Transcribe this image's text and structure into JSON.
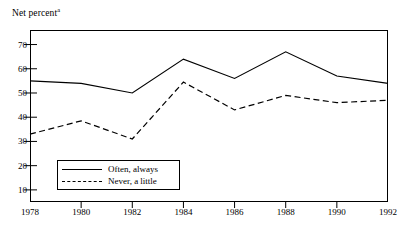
{
  "chart_data": {
    "type": "line",
    "title": "",
    "subtitle": "",
    "xlabel": "",
    "ylabel": "Net percent",
    "ylabel_superscript": "a",
    "grid": false,
    "legend_position": "inside-bottom-left",
    "categories": [
      "1978",
      "1980",
      "1982",
      "1984",
      "1986",
      "1988",
      "1990",
      "1992"
    ],
    "x": [
      1978,
      1980,
      1982,
      1984,
      1986,
      1988,
      1990,
      1992
    ],
    "xlim": [
      1978,
      1992
    ],
    "ylim": [
      5,
      76
    ],
    "yticks": [
      70,
      60,
      50,
      40,
      30,
      20,
      10
    ],
    "xticks": [
      1978,
      1980,
      1982,
      1984,
      1986,
      1988,
      1990,
      1992
    ],
    "series": [
      {
        "name": "Often, always",
        "style": "solid",
        "color": "#000000",
        "values": [
          55,
          54,
          50,
          64,
          56,
          67,
          57,
          54
        ]
      },
      {
        "name": "Never, a little",
        "style": "dashed",
        "color": "#000000",
        "values": [
          33,
          38.5,
          31,
          54.5,
          43,
          49,
          46,
          47
        ]
      }
    ]
  },
  "axes": {
    "y_caption_text": "Net percent",
    "y_caption_superscript": "a",
    "y_tick_labels": [
      "70",
      "60",
      "50",
      "40",
      "30",
      "20",
      "10"
    ],
    "x_tick_labels": [
      "1978",
      "1980",
      "1982",
      "1984",
      "1986",
      "1988",
      "1990",
      "1992"
    ]
  },
  "legend": {
    "entries": [
      {
        "label": "Often, always",
        "style": "solid"
      },
      {
        "label": "Never, a little",
        "style": "dashed"
      }
    ]
  }
}
